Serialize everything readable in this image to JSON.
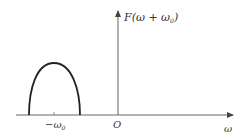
{
  "diagram": {
    "type": "spectrum-plot",
    "colors": {
      "axis": "#555555",
      "curve": "#222222",
      "text": "#333333",
      "background": "#ffffff"
    },
    "y_axis_label": {
      "main": "F(ω + ω",
      "subscript": "0",
      "close": ")"
    },
    "x_axis_label": "ω",
    "origin_label": "O",
    "tick_label": {
      "main": "−ω",
      "subscript": "0"
    },
    "curve": {
      "shape": "half-ellipse",
      "center_label": "−ω0",
      "x_start": 29,
      "x_peak": 54,
      "x_end": 80,
      "baseline_y": 115,
      "peak_y": 63
    }
  }
}
